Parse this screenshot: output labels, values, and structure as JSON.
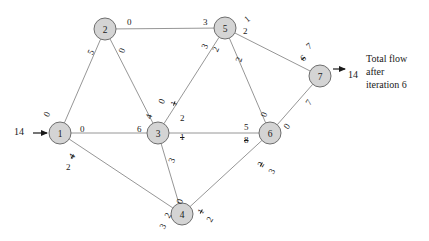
{
  "figure": {
    "type": "network-flow-diagram",
    "background_color": "#ffffff",
    "node_fill": "#d4d4d4",
    "node_stroke": "#6e6e6e",
    "edge_stroke": "#8a8a8a",
    "text_color": "#1a1a1a"
  },
  "nodes": [
    {
      "id": "1",
      "label": "1",
      "x": 60,
      "y": 133,
      "r": 11
    },
    {
      "id": "2",
      "label": "2",
      "x": 105,
      "y": 29,
      "r": 11
    },
    {
      "id": "3",
      "label": "3",
      "x": 158,
      "y": 133,
      "r": 11
    },
    {
      "id": "4",
      "label": "4",
      "x": 182,
      "y": 214,
      "r": 11
    },
    {
      "id": "5",
      "label": "5",
      "x": 225,
      "y": 28,
      "r": 11
    },
    {
      "id": "6",
      "label": "6",
      "x": 270,
      "y": 133,
      "r": 11
    },
    {
      "id": "7",
      "label": "7",
      "x": 320,
      "y": 76,
      "r": 11
    }
  ],
  "edges": [
    {
      "from": "1",
      "to": "2"
    },
    {
      "from": "1",
      "to": "3"
    },
    {
      "from": "1",
      "to": "4"
    },
    {
      "from": "2",
      "to": "3"
    },
    {
      "from": "2",
      "to": "5"
    },
    {
      "from": "3",
      "to": "5"
    },
    {
      "from": "3",
      "to": "4"
    },
    {
      "from": "3",
      "to": "6"
    },
    {
      "from": "5",
      "to": "6"
    },
    {
      "from": "5",
      "to": "7"
    },
    {
      "from": "4",
      "to": "6"
    },
    {
      "from": "6",
      "to": "7"
    }
  ],
  "edge_labels": [
    {
      "id": "l1-2-at1",
      "text": "0",
      "x": 45,
      "y": 110,
      "rot": -64,
      "struck": false
    },
    {
      "id": "l1-2-at2",
      "text": "5",
      "x": 89,
      "y": 48,
      "rot": -64,
      "struck": false
    },
    {
      "id": "l1-3-at1",
      "text": "0",
      "x": 80,
      "y": 125,
      "rot": 0,
      "struck": false
    },
    {
      "id": "l1-3-at3",
      "text": "6",
      "x": 137,
      "y": 125,
      "rot": 0,
      "struck": false
    },
    {
      "id": "l1-4-at1a",
      "text": "4",
      "x": 70,
      "y": 152,
      "rot": -58,
      "struck": true
    },
    {
      "id": "l1-4-at1b",
      "text": "2",
      "x": 66,
      "y": 163,
      "rot": 0,
      "struck": false
    },
    {
      "id": "l1-4-at4a",
      "text": "2",
      "x": 166,
      "y": 211,
      "rot": -60,
      "struck": false
    },
    {
      "id": "l1-4-at4b",
      "text": "3",
      "x": 161,
      "y": 222,
      "rot": -60,
      "struck": false
    },
    {
      "id": "l2-3-at2",
      "text": "0",
      "x": 120,
      "y": 46,
      "rot": -72,
      "struck": false
    },
    {
      "id": "l2-3-at3a",
      "text": "4",
      "x": 147,
      "y": 112,
      "rot": -72,
      "struck": false
    },
    {
      "id": "l2-3-at3b",
      "text": "0",
      "x": 160,
      "y": 97,
      "rot": -66,
      "struck": false
    },
    {
      "id": "l2-5-at2",
      "text": "0",
      "x": 127,
      "y": 18,
      "rot": 0,
      "struck": false
    },
    {
      "id": "l2-5-at5",
      "text": "3",
      "x": 203,
      "y": 18,
      "rot": 0,
      "struck": false
    },
    {
      "id": "l3-5-at3a",
      "text": "1",
      "x": 172,
      "y": 99,
      "rot": -70,
      "struck": true
    },
    {
      "id": "l3-5-at3b",
      "text": "2",
      "x": 180,
      "y": 114,
      "rot": 0,
      "struck": false
    },
    {
      "id": "l3-5-at5a",
      "text": "3",
      "x": 203,
      "y": 42,
      "rot": -66,
      "struck": false
    },
    {
      "id": "l3-5-at5b",
      "text": "2",
      "x": 214,
      "y": 45,
      "rot": -66,
      "struck": false
    },
    {
      "id": "l3-4-at3",
      "text": "3",
      "x": 170,
      "y": 156,
      "rot": -70,
      "struck": false
    },
    {
      "id": "l3-4-at4",
      "text": "0",
      "x": 178,
      "y": 197,
      "rot": -70,
      "struck": false
    },
    {
      "id": "l3-6-at3",
      "text": "1",
      "x": 180,
      "y": 133,
      "rot": 0,
      "struck": true
    },
    {
      "id": "l3-6-at6a",
      "text": "5",
      "x": 244,
      "y": 123,
      "rot": 0,
      "struck": false
    },
    {
      "id": "l3-6-at6b",
      "text": "8",
      "x": 244,
      "y": 136,
      "rot": 0,
      "struck": true
    },
    {
      "id": "l5-6-at5",
      "text": "2",
      "x": 237,
      "y": 55,
      "rot": -72,
      "struck": false
    },
    {
      "id": "l5-6-at6",
      "text": "0",
      "x": 262,
      "y": 110,
      "rot": -72,
      "struck": false
    },
    {
      "id": "l5-7-at5a",
      "text": "1",
      "x": 245,
      "y": 15,
      "rot": -40,
      "struck": false
    },
    {
      "id": "l5-7-at5b",
      "text": "2",
      "x": 243,
      "y": 27,
      "rot": 0,
      "struck": false
    },
    {
      "id": "l5-7-at7a",
      "text": "7",
      "x": 307,
      "y": 42,
      "rot": -40,
      "struck": false
    },
    {
      "id": "l5-7-at7b",
      "text": "6",
      "x": 301,
      "y": 54,
      "rot": -40,
      "struck": true
    },
    {
      "id": "l4-6-at4a",
      "text": "1",
      "x": 199,
      "y": 207,
      "rot": -60,
      "struck": true
    },
    {
      "id": "l4-6-at4b",
      "text": "2",
      "x": 208,
      "y": 215,
      "rot": -60,
      "struck": false
    },
    {
      "id": "l4-6-at6a",
      "text": "2",
      "x": 259,
      "y": 160,
      "rot": -60,
      "struck": true
    },
    {
      "id": "l4-6-at6b",
      "text": "3",
      "x": 270,
      "y": 167,
      "rot": -60,
      "struck": false
    },
    {
      "id": "l6-7-at6",
      "text": "0",
      "x": 285,
      "y": 122,
      "rot": -56,
      "struck": false
    },
    {
      "id": "l6-7-at7",
      "text": "7",
      "x": 307,
      "y": 98,
      "rot": -56,
      "struck": false
    }
  ],
  "source_flow": {
    "value": "14",
    "x": 14,
    "y": 126
  },
  "sink_flow": {
    "value": "14",
    "x": 348,
    "y": 69
  },
  "caption": {
    "lines": [
      "Total flow",
      "after",
      "iteration 6"
    ],
    "x": 366,
    "y": 52
  }
}
